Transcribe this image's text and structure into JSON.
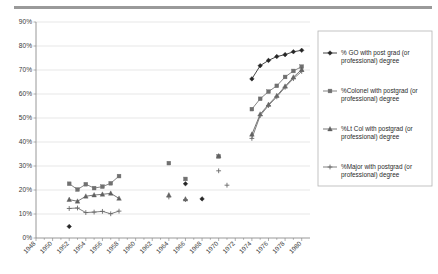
{
  "chart_data": {
    "type": "line",
    "title": "",
    "xlabel": "",
    "ylabel": "",
    "xlim": [
      1948,
      1981
    ],
    "ylim": [
      0,
      90
    ],
    "ytick_labels": [
      "0%",
      "10%",
      "20%",
      "30%",
      "40%",
      "50%",
      "60%",
      "70%",
      "80%",
      "90%"
    ],
    "ytick_values": [
      0,
      10,
      20,
      30,
      40,
      50,
      60,
      70,
      80,
      90
    ],
    "xtick_labels": [
      "1948",
      "1950",
      "1952",
      "1954",
      "1956",
      "1958",
      "1960",
      "1962",
      "1964",
      "1966",
      "1968",
      "1970",
      "1972",
      "1974",
      "1976",
      "1978",
      "1980"
    ],
    "xtick_values": [
      1948,
      1950,
      1952,
      1954,
      1956,
      1958,
      1960,
      1962,
      1964,
      1966,
      1968,
      1970,
      1972,
      1974,
      1976,
      1978,
      1980
    ],
    "grid": true,
    "legend_position": "right",
    "series": [
      {
        "name": "% GO with post grad (or professional) degree",
        "marker": "diamond",
        "color": "#262626",
        "segments": [
          {
            "x": [
              1952
            ],
            "y": [
              4.8
            ]
          },
          {
            "x": [
              1966
            ],
            "y": [
              22.6
            ]
          },
          {
            "x": [
              1968
            ],
            "y": [
              16.3
            ]
          },
          {
            "x": [
              1974,
              1975,
              1976,
              1977,
              1978,
              1979,
              1980
            ],
            "y": [
              66.3,
              71.8,
              74.0,
              75.6,
              76.4,
              77.6,
              78.2
            ]
          }
        ]
      },
      {
        "name": "%Colonel with postgrad (or professional) degree",
        "marker": "square",
        "color": "#707070",
        "segments": [
          {
            "x": [
              1952,
              1953,
              1954,
              1955,
              1956,
              1957,
              1958
            ],
            "y": [
              22.6,
              20.2,
              22.4,
              20.8,
              21.4,
              22.8,
              25.8
            ]
          },
          {
            "x": [
              1964
            ],
            "y": [
              31.2
            ]
          },
          {
            "x": [
              1966
            ],
            "y": [
              24.6
            ]
          },
          {
            "x": [
              1970
            ],
            "y": [
              34.0
            ]
          },
          {
            "x": [
              1974,
              1975,
              1976,
              1977,
              1978,
              1979,
              1980
            ],
            "y": [
              53.7,
              58.0,
              61.0,
              63.4,
              67.1,
              69.6,
              71.4
            ]
          }
        ]
      },
      {
        "name": "%Lt Col with postgrad (or professional) degree",
        "marker": "triangle",
        "color": "#606060",
        "segments": [
          {
            "x": [
              1952,
              1953,
              1954,
              1955,
              1956,
              1957,
              1958
            ],
            "y": [
              16.0,
              15.3,
              17.4,
              17.9,
              18.2,
              18.6,
              16.5
            ]
          },
          {
            "x": [
              1964
            ],
            "y": [
              17.9
            ]
          },
          {
            "x": [
              1966
            ],
            "y": [
              16.2
            ]
          },
          {
            "x": [
              1970
            ],
            "y": [
              34.2
            ]
          },
          {
            "x": [
              1974,
              1975,
              1976,
              1977,
              1978,
              1979,
              1980
            ],
            "y": [
              43.2,
              51.6,
              55.6,
              59.3,
              63.2,
              67.0,
              70.2
            ]
          }
        ]
      },
      {
        "name": "%Major with postgrad (or professional) degree",
        "marker": "plus",
        "color": "#6a6a6a",
        "segments": [
          {
            "x": [
              1952,
              1953,
              1954,
              1955,
              1956,
              1957,
              1958
            ],
            "y": [
              12.3,
              12.5,
              10.6,
              10.8,
              11.1,
              10.1,
              11.2
            ]
          },
          {
            "x": [
              1964
            ],
            "y": [
              17.1
            ]
          },
          {
            "x": [
              1966
            ],
            "y": [
              16.0
            ]
          },
          {
            "x": [
              1970
            ],
            "y": [
              28.0
            ]
          },
          {
            "x": [
              1971
            ],
            "y": [
              22.0
            ]
          },
          {
            "x": [
              1974,
              1975,
              1976,
              1977,
              1978,
              1979,
              1980
            ],
            "y": [
              41.5,
              51.0,
              55.2,
              58.8,
              62.8,
              66.4,
              69.4
            ]
          }
        ]
      }
    ]
  },
  "legend": {
    "items": [
      {
        "label": "% GO with post grad (or professional) degree",
        "marker": "diamond"
      },
      {
        "label": "%Colonel with postgrad (or professional) degree",
        "marker": "square"
      },
      {
        "label": "%Lt Col with postgrad (or professional) degree",
        "marker": "triangle"
      },
      {
        "label": "%Major with postgrad (or professional) degree",
        "marker": "plus"
      }
    ]
  }
}
